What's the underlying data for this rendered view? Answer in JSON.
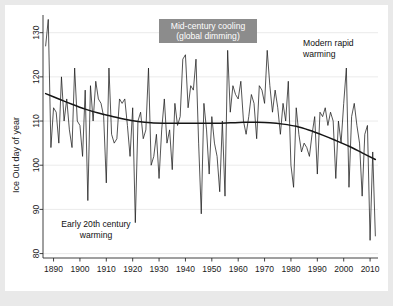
{
  "figure": {
    "background_color": "#e9e9e9",
    "panel_color": "#ffffff"
  },
  "annotations": {
    "mid_century": {
      "line1": "Mid-century cooling",
      "line2": "(global dimming)",
      "box_color": "#8c8c8c",
      "text_color": "#ffffff"
    },
    "modern": {
      "line1": "Modern rapid",
      "line2": "warming"
    },
    "early": {
      "line1": "Early 20th century",
      "line2": "warming"
    }
  },
  "chart_data": {
    "type": "line",
    "title": "",
    "xlabel": "",
    "ylabel": "Ice Out day of year",
    "xlim": [
      1886,
      2013
    ],
    "ylim": [
      79,
      134
    ],
    "grid": true,
    "legend": "none",
    "yticks": [
      80,
      90,
      100,
      110,
      120,
      130
    ],
    "xticks": [
      1890,
      1900,
      1910,
      1920,
      1930,
      1940,
      1950,
      1960,
      1970,
      1980,
      1990,
      2000,
      2010
    ],
    "series": [
      {
        "name": "Ice Out day of year",
        "type": "line",
        "color": "#1b1b1b",
        "x": [
          1887,
          1888,
          1889,
          1890,
          1891,
          1892,
          1893,
          1894,
          1895,
          1896,
          1897,
          1898,
          1899,
          1900,
          1901,
          1902,
          1903,
          1904,
          1905,
          1906,
          1907,
          1908,
          1909,
          1910,
          1911,
          1912,
          1913,
          1914,
          1915,
          1916,
          1917,
          1918,
          1919,
          1920,
          1921,
          1922,
          1923,
          1924,
          1925,
          1926,
          1927,
          1928,
          1929,
          1930,
          1931,
          1932,
          1933,
          1934,
          1935,
          1936,
          1937,
          1938,
          1939,
          1940,
          1941,
          1942,
          1943,
          1944,
          1945,
          1946,
          1947,
          1948,
          1949,
          1950,
          1951,
          1952,
          1953,
          1954,
          1955,
          1956,
          1957,
          1958,
          1959,
          1960,
          1961,
          1962,
          1963,
          1964,
          1965,
          1966,
          1967,
          1968,
          1969,
          1970,
          1971,
          1972,
          1973,
          1974,
          1975,
          1976,
          1977,
          1978,
          1979,
          1980,
          1981,
          1982,
          1983,
          1984,
          1985,
          1986,
          1987,
          1988,
          1989,
          1990,
          1991,
          1992,
          1993,
          1994,
          1995,
          1996,
          1997,
          1998,
          1999,
          2000,
          2001,
          2002,
          2003,
          2004,
          2005,
          2006,
          2007,
          2008,
          2009,
          2010,
          2011,
          2012
        ],
        "values": [
          127,
          133,
          104,
          113,
          112,
          105,
          120,
          110,
          115,
          108,
          104,
          122,
          110,
          109,
          102,
          117,
          92,
          118,
          110,
          119,
          115,
          114,
          111,
          96,
          122,
          107,
          105,
          106,
          115,
          114,
          115,
          109,
          102,
          113,
          87,
          110,
          112,
          106,
          108,
          122,
          100,
          102,
          107,
          97,
          108,
          115,
          105,
          108,
          99,
          114,
          109,
          111,
          124,
          125,
          113,
          118,
          117,
          124,
          105,
          89,
          114,
          108,
          98,
          111,
          105,
          102,
          94,
          110,
          93,
          126,
          112,
          118,
          116,
          115,
          119,
          110,
          107,
          111,
          116,
          114,
          106,
          118,
          117,
          114,
          126,
          118,
          112,
          117,
          113,
          107,
          114,
          110,
          119,
          100,
          95,
          113,
          107,
          103,
          105,
          104,
          102,
          107,
          111,
          98,
          112,
          111,
          113,
          109,
          112,
          110,
          97,
          110,
          105,
          114,
          122,
          95,
          111,
          114,
          109,
          105,
          93,
          107,
          109,
          83,
          103,
          84
        ]
      },
      {
        "name": "LOESS trend",
        "type": "line",
        "color": "#141414",
        "x": [
          1887,
          1892,
          1897,
          1902,
          1907,
          1912,
          1917,
          1922,
          1927,
          1932,
          1937,
          1942,
          1947,
          1952,
          1957,
          1962,
          1967,
          1972,
          1977,
          1982,
          1987,
          1992,
          1997,
          2002,
          2007,
          2012
        ],
        "values": [
          116.2,
          115.0,
          113.8,
          112.7,
          111.8,
          111.1,
          110.4,
          109.9,
          109.6,
          109.5,
          109.5,
          109.5,
          109.5,
          109.5,
          109.6,
          109.7,
          109.7,
          109.6,
          109.3,
          108.8,
          107.9,
          106.8,
          105.6,
          104.3,
          102.8,
          101.3
        ]
      }
    ]
  }
}
